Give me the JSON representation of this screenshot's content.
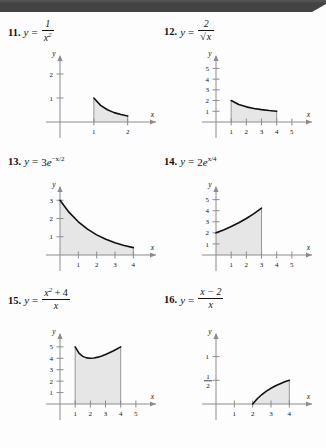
{
  "page": {
    "background_color": "#fdfdfd",
    "header_bar_color": "#434343",
    "curve_color": "#111111",
    "axis_color": "#8c8c8c",
    "shade_color": "#e6e6e6"
  },
  "problems": [
    {
      "number": "11.",
      "lhs": "y",
      "equals": "=",
      "equation_text": "y = 1/x^2",
      "fraction": {
        "numerator": "1",
        "denominator": "x",
        "denominator_exponent": "2"
      },
      "graph": {
        "x_axis_label": "x",
        "y_axis_label": "y",
        "x_ticks": [
          "1",
          "2"
        ],
        "y_ticks": [
          "1",
          "2"
        ],
        "x_tick_values": [
          1,
          2
        ],
        "y_tick_values": [
          1,
          2
        ],
        "shade_from": 1,
        "shade_to": 2,
        "curve_points": [
          [
            1,
            1
          ],
          [
            1.2,
            0.694
          ],
          [
            1.4,
            0.51
          ],
          [
            1.6,
            0.391
          ],
          [
            1.8,
            0.309
          ],
          [
            2,
            0.25
          ]
        ],
        "x_domain": [
          0,
          2.6
        ],
        "y_domain": [
          0,
          2.5
        ]
      }
    },
    {
      "number": "12.",
      "lhs": "y",
      "equals": "=",
      "equation_text": "y = 2/sqrt(x)",
      "fraction": {
        "numerator": "2",
        "denominator_radical": "x"
      },
      "graph": {
        "x_axis_label": "x",
        "y_axis_label": "y",
        "x_ticks": [
          "1",
          "2",
          "3",
          "4",
          "5"
        ],
        "y_ticks": [
          "1",
          "2",
          "3",
          "4",
          "5"
        ],
        "x_tick_values": [
          1,
          2,
          3,
          4,
          5
        ],
        "y_tick_values": [
          1,
          2,
          3,
          4,
          5
        ],
        "shade_from": 1,
        "shade_to": 4,
        "curve_points": [
          [
            1,
            2
          ],
          [
            1.5,
            1.633
          ],
          [
            2,
            1.414
          ],
          [
            2.5,
            1.265
          ],
          [
            3,
            1.155
          ],
          [
            3.5,
            1.069
          ],
          [
            4,
            1
          ]
        ],
        "x_domain": [
          0,
          5.8
        ],
        "y_domain": [
          0,
          5.6
        ]
      }
    },
    {
      "number": "13.",
      "lhs": "y",
      "equals": "=",
      "equation_text": "y = 3e^(-x/2)",
      "inline": {
        "coefficient": "3",
        "base": "e",
        "exponent": "−x/2"
      },
      "graph": {
        "x_axis_label": "x",
        "y_axis_label": "y",
        "x_ticks": [
          "1",
          "2",
          "3",
          "4"
        ],
        "y_ticks": [
          "1",
          "2",
          "3"
        ],
        "x_tick_values": [
          1,
          2,
          3,
          4
        ],
        "y_tick_values": [
          1,
          2,
          3
        ],
        "shade_from": 0,
        "shade_to": 4,
        "curve_points": [
          [
            0,
            3
          ],
          [
            0.5,
            2.336
          ],
          [
            1,
            1.82
          ],
          [
            1.5,
            1.417
          ],
          [
            2,
            1.104
          ],
          [
            2.5,
            0.86
          ],
          [
            3,
            0.669
          ],
          [
            3.5,
            0.521
          ],
          [
            4,
            0.406
          ]
        ],
        "x_domain": [
          0,
          4.8
        ],
        "y_domain": [
          0,
          3.4
        ]
      }
    },
    {
      "number": "14.",
      "lhs": "y",
      "equals": "=",
      "equation_text": "y = 2e^(x/4)",
      "inline": {
        "coefficient": "2",
        "base": "e",
        "exponent": "x/4"
      },
      "graph": {
        "x_axis_label": "x",
        "y_axis_label": "y",
        "x_ticks": [
          "1",
          "2",
          "3",
          "4",
          "5"
        ],
        "y_ticks": [
          "1",
          "2",
          "3",
          "4",
          "5"
        ],
        "x_tick_values": [
          1,
          2,
          3,
          4,
          5
        ],
        "y_tick_values": [
          1,
          2,
          3,
          4,
          5
        ],
        "shade_from": 0,
        "shade_to": 3,
        "curve_points": [
          [
            0,
            2
          ],
          [
            0.5,
            2.266
          ],
          [
            1,
            2.568
          ],
          [
            1.5,
            2.909
          ],
          [
            2,
            3.297
          ],
          [
            2.5,
            3.736
          ],
          [
            3,
            4.234
          ]
        ],
        "x_domain": [
          0,
          5.8
        ],
        "y_domain": [
          0,
          5.6
        ]
      }
    },
    {
      "number": "15.",
      "lhs": "y",
      "equals": "=",
      "equation_text": "y = (x^2 + 4)/x",
      "fraction": {
        "numerator": "x",
        "numerator_exponent": "2",
        "numerator_rest": "+ 4",
        "denominator": "x"
      },
      "graph": {
        "x_axis_label": "x",
        "y_axis_label": "y",
        "x_ticks": [
          "1",
          "2",
          "3",
          "4",
          "5"
        ],
        "y_ticks": [
          "1",
          "2",
          "3",
          "4",
          "5"
        ],
        "x_tick_values": [
          1,
          2,
          3,
          4,
          5
        ],
        "y_tick_values": [
          1,
          2,
          3,
          4,
          5
        ],
        "shade_from": 1,
        "shade_to": 4,
        "curve_points": [
          [
            1,
            5
          ],
          [
            1.25,
            4.45
          ],
          [
            1.5,
            4.167
          ],
          [
            1.75,
            4.036
          ],
          [
            2,
            4
          ],
          [
            2.25,
            4.028
          ],
          [
            2.5,
            4.1
          ],
          [
            2.75,
            4.205
          ],
          [
            3,
            4.333
          ],
          [
            3.25,
            4.481
          ],
          [
            3.5,
            4.643
          ],
          [
            3.75,
            4.817
          ],
          [
            4,
            5
          ]
        ],
        "x_domain": [
          0,
          5.8
        ],
        "y_domain": [
          0,
          5.6
        ]
      }
    },
    {
      "number": "16.",
      "lhs": "y",
      "equals": "=",
      "equation_text": "y = (x - 2)/x",
      "fraction": {
        "numerator": "x − 2",
        "denominator": "x"
      },
      "graph": {
        "x_axis_label": "x",
        "y_axis_label": "y",
        "x_ticks": [
          "1",
          "2",
          "3",
          "4"
        ],
        "y_ticks": [
          "1/2",
          "1"
        ],
        "x_tick_values": [
          1,
          2,
          3,
          4
        ],
        "y_tick_values": [
          0.5,
          1
        ],
        "shade_from": 2,
        "shade_to": 4,
        "curve_points": [
          [
            2,
            0
          ],
          [
            2.25,
            0.111
          ],
          [
            2.5,
            0.2
          ],
          [
            2.75,
            0.273
          ],
          [
            3,
            0.333
          ],
          [
            3.25,
            0.385
          ],
          [
            3.5,
            0.429
          ],
          [
            3.75,
            0.467
          ],
          [
            4,
            0.5
          ]
        ],
        "x_domain": [
          0,
          4.8
        ],
        "y_domain": [
          0,
          1.35
        ]
      }
    }
  ]
}
